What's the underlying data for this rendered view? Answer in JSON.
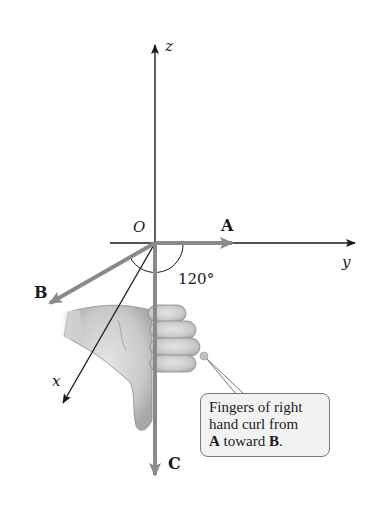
{
  "axes": {
    "z": {
      "label": "z"
    },
    "y": {
      "label": "y"
    },
    "x": {
      "label": "x"
    },
    "origin": {
      "label": "O"
    }
  },
  "vectors": {
    "A": {
      "label": "A",
      "color": "#8a8a8a"
    },
    "B": {
      "label": "B",
      "color": "#8a8a8a"
    },
    "C": {
      "label": "C",
      "color": "#8a8a8a"
    }
  },
  "angle": {
    "label": "120°"
  },
  "callout": {
    "line1": "Fingers of right",
    "line2": "hand curl from",
    "line3_bold_a": "A",
    "line3_mid": " toward ",
    "line3_bold_b": "B",
    "line3_end": "."
  },
  "colors": {
    "axis": "#1a1a1a",
    "vector": "#8a8a8a",
    "callout_bg": "#f2f2f2",
    "callout_border": "#777777"
  }
}
